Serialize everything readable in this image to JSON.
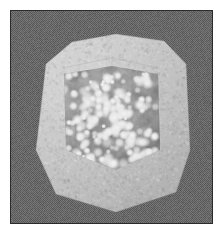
{
  "figure": {
    "title": "Volume rendering of translucent polyhedral crystal with internal particles",
    "caption": "",
    "canvas": {
      "width": 221,
      "height": 235
    },
    "margin": {
      "color": "#ffffff",
      "size_px": 10
    },
    "frame": {
      "x": 10,
      "y": 10,
      "width": 203,
      "height": 214,
      "border_color": "#2b2b2b",
      "border_width_px": 1
    },
    "background": {
      "name": "dithered-noise-backdrop",
      "base_color": "#6b6b6b",
      "dark_color": "#4e4e4e",
      "light_color": "#7e7e7e",
      "pattern": "fine-dither-noise"
    },
    "object": {
      "name": "translucent-polyhedron",
      "shape": "rounded-heptagonal-cube-silhouette",
      "fill_color": "#c9c9c9",
      "edge_color": "#b0b0b0",
      "opacity": 0.94,
      "outline_vertices": [
        [
          46,
          64
        ],
        [
          72,
          42
        ],
        [
          116,
          34
        ],
        [
          164,
          41
        ],
        [
          186,
          64
        ],
        [
          190,
          150
        ],
        [
          176,
          192
        ],
        [
          116,
          212
        ],
        [
          56,
          194
        ],
        [
          36,
          150
        ]
      ]
    },
    "inner_volume": {
      "name": "inner-dark-cube-face",
      "fill_color": "#8d8d8d",
      "opacity": 0.55,
      "bounds": {
        "x": 62,
        "y": 68,
        "width": 96,
        "height": 100
      },
      "vertices": [
        [
          64,
          74
        ],
        [
          112,
          66
        ],
        [
          158,
          74
        ],
        [
          160,
          150
        ],
        [
          116,
          170
        ],
        [
          66,
          150
        ]
      ]
    },
    "particles": {
      "name": "bright-speckle-particles",
      "color": "#e8e8e8",
      "glow_color": "#f4f4f4",
      "count": 210,
      "radius_min_px": 1.2,
      "radius_max_px": 3.4,
      "description": "soft-edged bright blobs clustered in two vertical lobes inside the cube"
    },
    "lighting": {
      "highlight_color": "#dedede",
      "shadow_color": "#8a8a8a",
      "light_direction": "top-left"
    },
    "palette": {
      "white": "#ffffff",
      "frame": "#2b2b2b",
      "backdrop": "#6b6b6b",
      "crystal": "#c9c9c9",
      "core": "#8d8d8d",
      "speckle": "#e8e8e8"
    }
  }
}
